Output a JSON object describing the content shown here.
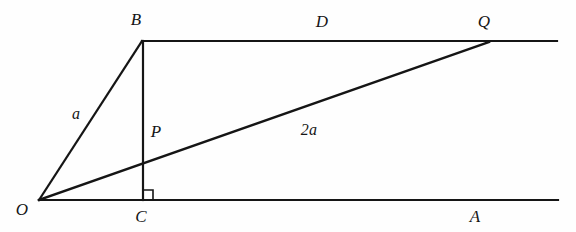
{
  "figure": {
    "kind": "geometry-diagram",
    "width": 576,
    "height": 232,
    "background_color": "#fefefe",
    "stroke_color": "#151515"
  },
  "points": {
    "O": {
      "label": "O",
      "x": 39,
      "y": 200,
      "label_x": 22,
      "label_y": 209
    },
    "C": {
      "label": "C",
      "x": 143,
      "y": 200,
      "label_x": 141,
      "label_y": 216
    },
    "A": {
      "label": "A",
      "x": 558,
      "y": 200,
      "label_x": 475,
      "label_y": 216
    },
    "B": {
      "label": "B",
      "x": 142,
      "y": 41,
      "label_x": 136,
      "label_y": 19
    },
    "D": {
      "label": "D",
      "x": 322,
      "y": 41,
      "label_x": 322,
      "label_y": 21
    },
    "Q": {
      "label": "Q",
      "x": 488,
      "y": 42,
      "label_x": 484,
      "label_y": 21
    },
    "P": {
      "label": "P",
      "x": 143,
      "y": 162,
      "label_x": 156,
      "label_y": 131
    }
  },
  "lines": {
    "top_ray": {
      "name": "upper-horizontal-line",
      "x1": 142,
      "y1": 41,
      "x2": 557,
      "y2": 41
    },
    "bottom_ray": {
      "name": "lower-horizontal-line",
      "x1": 39,
      "y1": 200,
      "x2": 558,
      "y2": 200
    },
    "segment_OB": {
      "name": "segment-OB",
      "x1": 39,
      "y1": 200,
      "x2": 142,
      "y2": 41
    },
    "segment_BC": {
      "name": "segment-BC",
      "x1": 143,
      "y1": 41,
      "x2": 143,
      "y2": 200
    },
    "segment_OQ": {
      "name": "segment-OQ",
      "x1": 39,
      "y1": 200,
      "x2": 489,
      "y2": 42
    }
  },
  "length_labels": {
    "a": {
      "text": "a",
      "x": 76,
      "y": 114
    },
    "two_a": {
      "text": "2a",
      "x": 309,
      "y": 130
    }
  },
  "right_angle": {
    "name": "right-angle-marker-at-C",
    "vertex_x": 143,
    "vertex_y": 200,
    "size": 10,
    "direction": "up-right"
  }
}
